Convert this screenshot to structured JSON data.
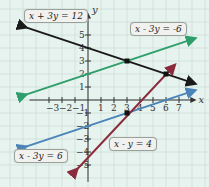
{
  "chart_data": {
    "type": "line",
    "title": "",
    "xlabel": "x",
    "ylabel": "y",
    "xlim": [
      -5,
      8
    ],
    "ylim": [
      -6,
      7
    ],
    "grid": true,
    "x_ticks": [
      -3,
      -2,
      -1,
      1,
      2,
      3,
      4,
      5,
      6,
      7
    ],
    "y_ticks": [
      5,
      4,
      3,
      2,
      1,
      -1,
      -2,
      -3,
      -4,
      -5
    ],
    "series": [
      {
        "name": "x + 3y = 12",
        "color": "#1a1a1a",
        "from": [
          -5,
          5.667
        ],
        "to": [
          8,
          1.333
        ]
      },
      {
        "name": "x - 3y = -6",
        "color": "#2e9e6a",
        "from": [
          -5,
          0.333
        ],
        "to": [
          8,
          4.667
        ]
      },
      {
        "name": "x - 3y = 6",
        "color": "#4a84b8",
        "from": [
          -5,
          -3.667
        ],
        "to": [
          8,
          0.667
        ]
      },
      {
        "name": "x - y = 4",
        "color": "#8b2a3c",
        "from": [
          -1,
          -5.5
        ],
        "to": [
          6.5,
          2.5
        ]
      }
    ],
    "intersections": [
      [
        3,
        3
      ],
      [
        6,
        2
      ],
      [
        3,
        -1
      ]
    ]
  },
  "labels": {
    "l1": "x + 3y = 12",
    "l2": "x - 3y = -6",
    "l3": "x - 3y = 6",
    "l4": "x - y = 4"
  },
  "axes": {
    "x": "x",
    "y": "y"
  }
}
